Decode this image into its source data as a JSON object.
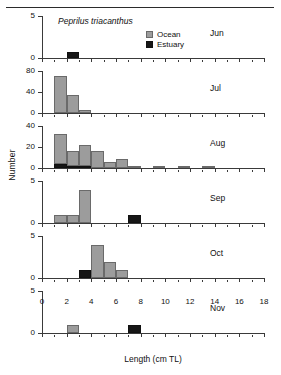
{
  "figure": {
    "species_label": "Peprilus triacanthus",
    "y_axis_label": "Number",
    "x_axis_label": "Length (cm TL)",
    "legend": {
      "ocean_label": "Ocean",
      "estuary_label": "Estuary",
      "ocean_color": "#9c9c9c",
      "estuary_color": "#161616"
    }
  },
  "chart_data": {
    "type": "bar",
    "title": "Peprilus triacanthus",
    "xlabel": "Length (cm TL)",
    "ylabel": "Number",
    "xlim": [
      0,
      18
    ],
    "xticks": [
      0,
      2,
      4,
      6,
      8,
      10,
      12,
      14,
      16,
      18
    ],
    "xtick_labels": [
      "0",
      "2",
      "4",
      "6",
      "8",
      "10",
      "12",
      "14",
      "16",
      "18"
    ],
    "grid": false,
    "legend_position": "top-right-panel-1",
    "series_names": [
      "Ocean",
      "Estuary"
    ],
    "bin_width": 1,
    "panels": [
      {
        "label": "Jun",
        "ylim": [
          0,
          5
        ],
        "yticks": [
          0,
          5
        ],
        "ytick_labels": [
          "0",
          "5"
        ],
        "bins": [
          {
            "x": 3,
            "ocean": 0,
            "estuary": 0.7
          }
        ]
      },
      {
        "label": "Jul",
        "ylim": [
          0,
          80
        ],
        "yticks": [
          0,
          40,
          80
        ],
        "ytick_labels": [
          "0",
          "40",
          "80"
        ],
        "bins": [
          {
            "x": 2,
            "ocean": 73,
            "estuary": 0
          },
          {
            "x": 3,
            "ocean": 35,
            "estuary": 0
          },
          {
            "x": 4,
            "ocean": 5,
            "estuary": 0
          }
        ]
      },
      {
        "label": "Aug",
        "ylim": [
          0,
          40
        ],
        "yticks": [
          0,
          20,
          40
        ],
        "ytick_labels": [
          "0",
          "20",
          "40"
        ],
        "bins": [
          {
            "x": 2,
            "ocean": 29,
            "estuary": 4
          },
          {
            "x": 3,
            "ocean": 15,
            "estuary": 1.5
          },
          {
            "x": 4,
            "ocean": 21,
            "estuary": 1.5
          },
          {
            "x": 5,
            "ocean": 17,
            "estuary": 0
          },
          {
            "x": 6,
            "ocean": 6,
            "estuary": 0
          },
          {
            "x": 7,
            "ocean": 9,
            "estuary": 0
          },
          {
            "x": 8,
            "ocean": 2,
            "estuary": 0
          },
          {
            "x": 10,
            "ocean": 0.6,
            "estuary": 0
          },
          {
            "x": 12,
            "ocean": 1,
            "estuary": 0
          },
          {
            "x": 14,
            "ocean": 0.6,
            "estuary": 0
          }
        ]
      },
      {
        "label": "Sep",
        "ylim": [
          0,
          5
        ],
        "yticks": [
          0,
          5
        ],
        "ytick_labels": [
          "0",
          "5"
        ],
        "bins": [
          {
            "x": 2,
            "ocean": 1,
            "estuary": 0
          },
          {
            "x": 3,
            "ocean": 1,
            "estuary": 0
          },
          {
            "x": 4,
            "ocean": 4,
            "estuary": 0
          },
          {
            "x": 8,
            "ocean": 0,
            "estuary": 1
          }
        ]
      },
      {
        "label": "Oct",
        "ylim": [
          0,
          5
        ],
        "yticks": [
          0,
          5
        ],
        "ytick_labels": [
          "0",
          "5"
        ],
        "bins": [
          {
            "x": 4,
            "ocean": 0,
            "estuary": 1
          },
          {
            "x": 5,
            "ocean": 4,
            "estuary": 0
          },
          {
            "x": 6,
            "ocean": 2,
            "estuary": 0
          },
          {
            "x": 7,
            "ocean": 1,
            "estuary": 0
          }
        ]
      },
      {
        "label": "Nov",
        "ylim": [
          0,
          5
        ],
        "yticks": [
          0,
          5
        ],
        "ytick_labels": [
          "0",
          "5"
        ],
        "bins": [
          {
            "x": 3,
            "ocean": 1,
            "estuary": 0
          },
          {
            "x": 8,
            "ocean": 0,
            "estuary": 1
          }
        ]
      }
    ]
  }
}
